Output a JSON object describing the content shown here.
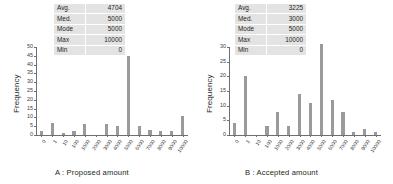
{
  "figure": {
    "background": "#ffffff",
    "bar_color": "#9a9a9a",
    "axis_color": "#6f6f6f",
    "table_bg": "#e3e3e3"
  },
  "panels": [
    {
      "id": "A",
      "caption": "A : Proposed amount",
      "stats": {
        "rows": [
          {
            "key": "Avg.",
            "value": "4704"
          },
          {
            "key": "Med.",
            "value": "5000"
          },
          {
            "key": "Mode",
            "value": "5000"
          },
          {
            "key": "Max",
            "value": "10000"
          },
          {
            "key": "Min",
            "value": "0"
          }
        ]
      },
      "chart_data": {
        "type": "bar",
        "title": "",
        "xlabel": "",
        "ylabel": "Frequency",
        "categories": [
          "0",
          "1",
          "10",
          "100",
          "1000",
          "2000",
          "3000",
          "4000",
          "5000",
          "6000",
          "7000",
          "8000",
          "9000",
          "10000"
        ],
        "values": [
          2,
          7,
          1,
          2,
          6,
          0,
          6,
          5,
          45,
          5,
          3,
          2,
          2,
          11
        ],
        "ylim": [
          0,
          50
        ],
        "yticks": [
          0,
          5,
          10,
          15,
          20,
          25,
          30,
          35,
          40,
          45,
          50
        ],
        "grid": false,
        "legend": "none"
      }
    },
    {
      "id": "B",
      "caption": "B : Accepted amount",
      "stats": {
        "rows": [
          {
            "key": "Avg.",
            "value": "3225"
          },
          {
            "key": "Med.",
            "value": "3000"
          },
          {
            "key": "Mode",
            "value": "5000"
          },
          {
            "key": "Max",
            "value": "10000"
          },
          {
            "key": "Min",
            "value": "0"
          }
        ]
      },
      "chart_data": {
        "type": "bar",
        "title": "",
        "xlabel": "",
        "ylabel": "Frequency",
        "categories": [
          "0",
          "1",
          "10",
          "100",
          "1000",
          "2000",
          "3000",
          "4000",
          "5000",
          "6000",
          "7000",
          "8000",
          "9000",
          "10000"
        ],
        "values": [
          4,
          20,
          0,
          3,
          8,
          3,
          14,
          11,
          31,
          12,
          8,
          1,
          2,
          1,
          5
        ],
        "ylim": [
          0,
          30
        ],
        "yticks": [
          0,
          5,
          10,
          15,
          20,
          25,
          30
        ],
        "grid": false,
        "legend": "none"
      }
    }
  ]
}
